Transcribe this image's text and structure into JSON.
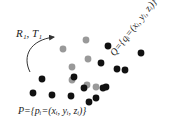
{
  "diagram": {
    "type": "point-cloud-registration",
    "transform_label": "R₁, T₁",
    "source_cloud_label": "P={pᵢ=(xᵢ, yᵢ, zᵢ)}",
    "target_cloud_label": "Q={qᵢ=(xᵢ, yᵢ, zᵢ)}",
    "colors": {
      "target_points": "#111111",
      "source_points": "#999999",
      "arrow": "#333333",
      "text": "#222222"
    },
    "note": "Point coordinates below are approximate placements estimated by eye from zoomed crops, not measured data.",
    "gray_points": [
      {
        "x": 86,
        "y": 40
      },
      {
        "x": 63,
        "y": 49
      },
      {
        "x": 88,
        "y": 59
      },
      {
        "x": 72,
        "y": 67
      },
      {
        "x": 87,
        "y": 85
      },
      {
        "x": 96,
        "y": 87
      },
      {
        "x": 72,
        "y": 80
      }
    ],
    "black_points": [
      {
        "x": 108,
        "y": 46
      },
      {
        "x": 141,
        "y": 53
      },
      {
        "x": 101,
        "y": 63
      },
      {
        "x": 117,
        "y": 69
      },
      {
        "x": 125,
        "y": 70
      },
      {
        "x": 42,
        "y": 79
      },
      {
        "x": 74,
        "y": 77
      },
      {
        "x": 33,
        "y": 93
      },
      {
        "x": 52,
        "y": 95
      },
      {
        "x": 71,
        "y": 96
      },
      {
        "x": 106,
        "y": 87
      },
      {
        "x": 84,
        "y": 88
      },
      {
        "x": 103,
        "y": 88
      },
      {
        "x": 96,
        "y": 98
      },
      {
        "x": 89,
        "y": 102
      }
    ]
  },
  "chart_data": {
    "type": "scatter",
    "title": "",
    "approximate": true,
    "note": "Positions are approximate, eyeballed from the screenshot.",
    "series": [
      {
        "name": "Q (gray)",
        "points": [
          [
            86,
            40
          ],
          [
            63,
            49
          ],
          [
            88,
            59
          ],
          [
            72,
            67
          ],
          [
            87,
            85
          ],
          [
            96,
            87
          ],
          [
            72,
            80
          ]
        ]
      },
      {
        "name": "P (black)",
        "points": [
          [
            108,
            46
          ],
          [
            141,
            53
          ],
          [
            101,
            63
          ],
          [
            117,
            69
          ],
          [
            125,
            70
          ],
          [
            42,
            79
          ],
          [
            74,
            77
          ],
          [
            33,
            93
          ],
          [
            52,
            95
          ],
          [
            71,
            96
          ],
          [
            106,
            87
          ],
          [
            84,
            88
          ],
          [
            103,
            88
          ],
          [
            96,
            98
          ],
          [
            89,
            102
          ]
        ]
      }
    ],
    "annotations": [
      "R₁, T₁",
      "P={pᵢ=(xᵢ, yᵢ, zᵢ)}",
      "Q={qᵢ=(xᵢ, yᵢ, zᵢ)}"
    ]
  }
}
